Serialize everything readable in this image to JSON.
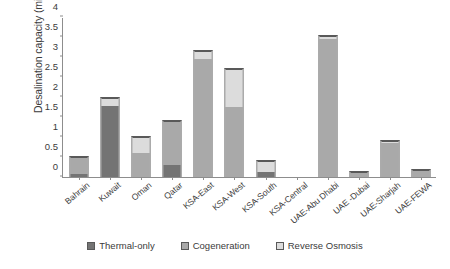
{
  "chart_data": {
    "type": "bar",
    "title": "",
    "xlabel": "",
    "ylabel": "Desalination capacity (million m³/day)",
    "ylim": [
      0,
      4
    ],
    "ytick_labels": [
      "0",
      "0.5",
      "1",
      "1.5",
      "2",
      "2.5",
      "3",
      "3.5",
      "4"
    ],
    "ytick_values": [
      0,
      0.5,
      1,
      1.5,
      2,
      2.5,
      3,
      3.5,
      4
    ],
    "grid": false,
    "stacked": true,
    "legend_position": "bottom",
    "categories": [
      "Bahrain",
      "Kuwait",
      "Oman",
      "Qatar",
      "KSA-East",
      "KSA-West",
      "KSA-South",
      "KSA-Central",
      "UAE-Abu Dhabi",
      "UAE -Dubai",
      "UAE-Sharjah",
      "UAE-FEWA"
    ],
    "series": [
      {
        "name": "Thermal-only",
        "color": "#747474",
        "values": [
          0.07,
          1.78,
          0.0,
          0.3,
          0.0,
          0.0,
          0.13,
          0.0,
          0.0,
          0.0,
          0.0,
          0.0
        ]
      },
      {
        "name": "Cogeneration",
        "color": "#a9a9a9",
        "values": [
          0.43,
          0.0,
          0.6,
          1.1,
          2.95,
          1.75,
          0.0,
          0.0,
          3.45,
          0.1,
          0.85,
          0.15
        ]
      },
      {
        "name": "Reverse Osmosis",
        "color": "#dcdcdc",
        "values": [
          0.0,
          0.2,
          0.4,
          0.0,
          0.2,
          0.95,
          0.27,
          0.0,
          0.07,
          0.02,
          0.05,
          0.03
        ]
      }
    ],
    "totals": [
      0.5,
      1.98,
      1.0,
      1.4,
      3.15,
      2.7,
      0.4,
      0.0,
      3.52,
      0.12,
      0.9,
      0.18
    ]
  },
  "legend": {
    "items": [
      {
        "label": "Thermal-only",
        "key": "thermal"
      },
      {
        "label": "Cogeneration",
        "key": "cogen"
      },
      {
        "label": "Reverse Osmosis",
        "key": "ro"
      }
    ]
  }
}
